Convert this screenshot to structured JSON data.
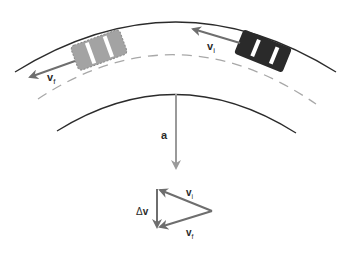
{
  "diagram": {
    "colors": {
      "road_edge": "#2b2b2b",
      "center_line": "#a8a8a8",
      "vector": "#6e6e6e",
      "accel_vector": "#9a9a9a",
      "car_initial": "#2a2a2a",
      "car_final": "#9e9e9e",
      "car_stripe": "#ffffff",
      "label": "#2a2a2a"
    },
    "road": {
      "outer_edge": "outer-road-edge",
      "center_line": "dashed-center-line",
      "inner_edge": "inner-road-edge"
    },
    "cars": [
      {
        "id": "car-initial",
        "description": "dark car at initial position",
        "style": "solid-dark"
      },
      {
        "id": "car-final",
        "description": "gray car at final position",
        "style": "dashed-outline-gray"
      }
    ],
    "labels": {
      "v_initial": {
        "main": "v",
        "sub": "i"
      },
      "v_final": {
        "main": "v",
        "sub": "f"
      },
      "acceleration": "a",
      "triangle_v_initial": {
        "main": "v",
        "sub": "i"
      },
      "triangle_v_final": {
        "main": "v",
        "sub": "f"
      },
      "delta_v": {
        "symbol": "Δ",
        "main": "v"
      }
    },
    "vector_triangle": {
      "vectors": [
        "v_i",
        "v_f",
        "Δv"
      ],
      "relation": "Δv = v_f − v_i"
    }
  }
}
